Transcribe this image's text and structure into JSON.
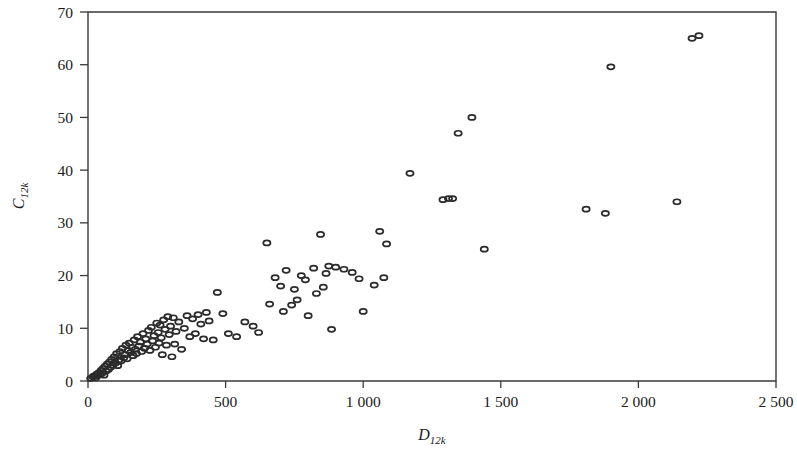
{
  "figure": {
    "background_color": "#ffffff",
    "axis_color": "#3a3a3a",
    "marker_color": "#2b2b2b"
  },
  "chart_data": {
    "type": "scatter",
    "title": "",
    "subtitle": "",
    "xlabel": "D",
    "xlabel_sub": "12k",
    "ylabel": "C",
    "ylabel_sub": "12k",
    "xlim": [
      0,
      2500
    ],
    "ylim": [
      0,
      70
    ],
    "grid": false,
    "legend": null,
    "xticks": [
      0,
      500,
      1000,
      1500,
      2000,
      2500
    ],
    "xtick_labels": [
      "0",
      "500",
      "1 000",
      "1 500",
      "2 000",
      "2 500"
    ],
    "yticks": [
      0,
      10,
      20,
      30,
      40,
      50,
      60,
      70
    ],
    "ytick_labels": [
      "0",
      "10",
      "20",
      "30",
      "40",
      "50",
      "60",
      "70"
    ],
    "marker": "open-ellipse",
    "series": [
      {
        "name": "D12k vs C12k",
        "points": [
          [
            10,
            0.5
          ],
          [
            18,
            0.8
          ],
          [
            22,
            1.0
          ],
          [
            28,
            0.6
          ],
          [
            32,
            1.3
          ],
          [
            35,
            1.0
          ],
          [
            40,
            1.6
          ],
          [
            44,
            1.2
          ],
          [
            48,
            2.0
          ],
          [
            52,
            1.5
          ],
          [
            55,
            2.4
          ],
          [
            58,
            1.1
          ],
          [
            62,
            2.8
          ],
          [
            66,
            1.9
          ],
          [
            70,
            3.2
          ],
          [
            74,
            2.2
          ],
          [
            78,
            3.6
          ],
          [
            82,
            2.6
          ],
          [
            86,
            4.1
          ],
          [
            90,
            3.0
          ],
          [
            95,
            4.6
          ],
          [
            100,
            3.4
          ],
          [
            104,
            5.2
          ],
          [
            108,
            2.9
          ],
          [
            112,
            4.0
          ],
          [
            116,
            5.6
          ],
          [
            120,
            3.8
          ],
          [
            125,
            6.2
          ],
          [
            130,
            4.4
          ],
          [
            134,
            5.0
          ],
          [
            138,
            6.8
          ],
          [
            142,
            4.2
          ],
          [
            146,
            5.8
          ],
          [
            150,
            7.2
          ],
          [
            155,
            5.4
          ],
          [
            160,
            6.4
          ],
          [
            164,
            4.8
          ],
          [
            168,
            7.8
          ],
          [
            172,
            6.0
          ],
          [
            176,
            5.2
          ],
          [
            180,
            8.4
          ],
          [
            185,
            6.6
          ],
          [
            190,
            7.4
          ],
          [
            195,
            5.6
          ],
          [
            200,
            9.0
          ],
          [
            205,
            6.2
          ],
          [
            210,
            8.0
          ],
          [
            215,
            7.0
          ],
          [
            220,
            9.6
          ],
          [
            225,
            5.8
          ],
          [
            230,
            10.2
          ],
          [
            235,
            7.6
          ],
          [
            240,
            8.6
          ],
          [
            245,
            6.4
          ],
          [
            250,
            11.0
          ],
          [
            255,
            9.2
          ],
          [
            258,
            7.2
          ],
          [
            262,
            10.6
          ],
          [
            266,
            8.2
          ],
          [
            270,
            5.0
          ],
          [
            275,
            11.6
          ],
          [
            280,
            9.8
          ],
          [
            285,
            6.8
          ],
          [
            290,
            12.2
          ],
          [
            295,
            8.8
          ],
          [
            300,
            10.4
          ],
          [
            305,
            4.6
          ],
          [
            310,
            12.0
          ],
          [
            315,
            7.0
          ],
          [
            320,
            9.4
          ],
          [
            330,
            11.2
          ],
          [
            340,
            6.0
          ],
          [
            350,
            10.0
          ],
          [
            360,
            12.4
          ],
          [
            370,
            8.4
          ],
          [
            380,
            11.8
          ],
          [
            390,
            9.0
          ],
          [
            400,
            12.6
          ],
          [
            410,
            10.8
          ],
          [
            420,
            8.0
          ],
          [
            430,
            13.0
          ],
          [
            440,
            11.4
          ],
          [
            455,
            7.8
          ],
          [
            470,
            16.8
          ],
          [
            490,
            12.8
          ],
          [
            510,
            9.0
          ],
          [
            540,
            8.4
          ],
          [
            570,
            11.2
          ],
          [
            600,
            10.4
          ],
          [
            620,
            9.2
          ],
          [
            650,
            26.2
          ],
          [
            660,
            14.6
          ],
          [
            680,
            19.6
          ],
          [
            700,
            18.0
          ],
          [
            710,
            13.2
          ],
          [
            720,
            21.0
          ],
          [
            740,
            14.4
          ],
          [
            750,
            17.4
          ],
          [
            760,
            15.4
          ],
          [
            775,
            20.0
          ],
          [
            790,
            19.2
          ],
          [
            800,
            12.4
          ],
          [
            820,
            21.4
          ],
          [
            830,
            16.6
          ],
          [
            845,
            27.8
          ],
          [
            855,
            17.8
          ],
          [
            865,
            20.4
          ],
          [
            875,
            21.8
          ],
          [
            885,
            9.8
          ],
          [
            900,
            21.6
          ],
          [
            930,
            21.2
          ],
          [
            960,
            20.6
          ],
          [
            985,
            19.4
          ],
          [
            1000,
            13.2
          ],
          [
            1040,
            18.2
          ],
          [
            1060,
            28.4
          ],
          [
            1075,
            19.6
          ],
          [
            1085,
            26.0
          ],
          [
            1170,
            39.4
          ],
          [
            1290,
            34.4
          ],
          [
            1310,
            34.6
          ],
          [
            1325,
            34.6
          ],
          [
            1345,
            47.0
          ],
          [
            1395,
            50.0
          ],
          [
            1440,
            25.0
          ],
          [
            1810,
            32.6
          ],
          [
            1880,
            31.8
          ],
          [
            1900,
            59.6
          ],
          [
            2140,
            34.0
          ],
          [
            2195,
            65.0
          ],
          [
            2220,
            65.5
          ]
        ]
      }
    ]
  }
}
